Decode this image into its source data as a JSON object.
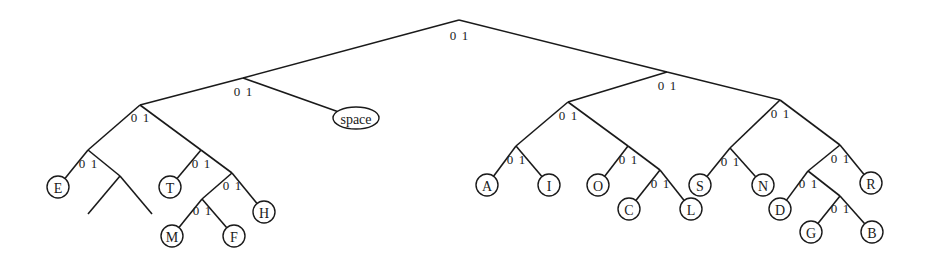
{
  "diagram": {
    "type": "huffman-tree",
    "bit_labels": {
      "left": "0",
      "right": "1"
    },
    "nodes": [
      {
        "id": "root",
        "x": 459,
        "y": 20
      },
      {
        "id": "n0",
        "x": 243,
        "y": 78
      },
      {
        "id": "n1",
        "x": 667,
        "y": 72
      },
      {
        "id": "n00",
        "x": 140,
        "y": 105
      },
      {
        "id": "n000",
        "x": 88,
        "y": 150
      },
      {
        "id": "n001",
        "x": 201,
        "y": 150
      },
      {
        "id": "n0001",
        "x": 120,
        "y": 176
      },
      {
        "id": "n0011",
        "x": 232,
        "y": 173
      },
      {
        "id": "n00110",
        "x": 202,
        "y": 199
      },
      {
        "id": "n10",
        "x": 568,
        "y": 102
      },
      {
        "id": "n11",
        "x": 780,
        "y": 100
      },
      {
        "id": "n100",
        "x": 516,
        "y": 146
      },
      {
        "id": "n101",
        "x": 628,
        "y": 146
      },
      {
        "id": "n1011",
        "x": 660,
        "y": 170
      },
      {
        "id": "n110",
        "x": 730,
        "y": 148
      },
      {
        "id": "n111",
        "x": 840,
        "y": 145
      },
      {
        "id": "n1110",
        "x": 808,
        "y": 171
      },
      {
        "id": "n11101",
        "x": 840,
        "y": 196
      }
    ],
    "leaves": [
      {
        "id": "space",
        "label": "space",
        "x": 356,
        "y": 118,
        "shape": "ellipse"
      },
      {
        "id": "E",
        "label": "E",
        "x": 58,
        "y": 187
      },
      {
        "id": "T",
        "label": "T",
        "x": 170,
        "y": 187
      },
      {
        "id": "H",
        "label": "H",
        "x": 264,
        "y": 212
      },
      {
        "id": "M",
        "label": "M",
        "x": 172,
        "y": 236
      },
      {
        "id": "F",
        "label": "F",
        "x": 234,
        "y": 236
      },
      {
        "id": "A",
        "label": "A",
        "x": 487,
        "y": 185
      },
      {
        "id": "I",
        "label": "I",
        "x": 549,
        "y": 185
      },
      {
        "id": "O",
        "label": "O",
        "x": 598,
        "y": 185
      },
      {
        "id": "C",
        "label": "C",
        "x": 629,
        "y": 209
      },
      {
        "id": "L",
        "label": "L",
        "x": 691,
        "y": 209
      },
      {
        "id": "S",
        "label": "S",
        "x": 700,
        "y": 185
      },
      {
        "id": "N",
        "label": "N",
        "x": 763,
        "y": 185
      },
      {
        "id": "D",
        "label": "D",
        "x": 780,
        "y": 209
      },
      {
        "id": "R",
        "label": "R",
        "x": 871,
        "y": 183
      },
      {
        "id": "G",
        "label": "G",
        "x": 811,
        "y": 232
      },
      {
        "id": "B",
        "label": "B",
        "x": 872,
        "y": 232
      }
    ],
    "edges": [
      [
        "root",
        "n0"
      ],
      [
        "root",
        "n1"
      ],
      [
        "n0",
        "n00"
      ],
      [
        "n0",
        "space"
      ],
      [
        "n00",
        "n000"
      ],
      [
        "n00",
        "n001"
      ],
      [
        "n000",
        "E"
      ],
      [
        "n000",
        "n0001"
      ],
      [
        "n001",
        "T"
      ],
      [
        "n001",
        "n0011"
      ],
      [
        "n0011",
        "n00110"
      ],
      [
        "n0011",
        "H"
      ],
      [
        "n00110",
        "M"
      ],
      [
        "n00110",
        "F"
      ],
      [
        "n1",
        "n10"
      ],
      [
        "n1",
        "n11"
      ],
      [
        "n10",
        "n100"
      ],
      [
        "n10",
        "n101"
      ],
      [
        "n100",
        "A"
      ],
      [
        "n100",
        "I"
      ],
      [
        "n101",
        "O"
      ],
      [
        "n101",
        "n1011"
      ],
      [
        "n1011",
        "C"
      ],
      [
        "n1011",
        "L"
      ],
      [
        "n11",
        "n110"
      ],
      [
        "n11",
        "n111"
      ],
      [
        "n110",
        "S"
      ],
      [
        "n110",
        "N"
      ],
      [
        "n111",
        "n1110"
      ],
      [
        "n111",
        "R"
      ],
      [
        "n1110",
        "D"
      ],
      [
        "n1110",
        "n11101"
      ],
      [
        "n11101",
        "G"
      ],
      [
        "n11101",
        "B"
      ]
    ],
    "dangling": [
      {
        "from": "n0001",
        "to_x": 88,
        "to_y": 214
      },
      {
        "from": "n0001",
        "to_x": 152,
        "to_y": 214
      }
    ],
    "bit_positions": [
      {
        "x": 459,
        "y": 40
      },
      {
        "x": 243,
        "y": 96
      },
      {
        "x": 667,
        "y": 90
      },
      {
        "x": 140,
        "y": 122
      },
      {
        "x": 88,
        "y": 168
      },
      {
        "x": 201,
        "y": 168
      },
      {
        "x": 232,
        "y": 190
      },
      {
        "x": 202,
        "y": 215
      },
      {
        "x": 568,
        "y": 120
      },
      {
        "x": 780,
        "y": 118
      },
      {
        "x": 516,
        "y": 164
      },
      {
        "x": 628,
        "y": 164
      },
      {
        "x": 660,
        "y": 188
      },
      {
        "x": 730,
        "y": 166
      },
      {
        "x": 840,
        "y": 163
      },
      {
        "x": 808,
        "y": 188
      },
      {
        "x": 840,
        "y": 213
      }
    ]
  }
}
